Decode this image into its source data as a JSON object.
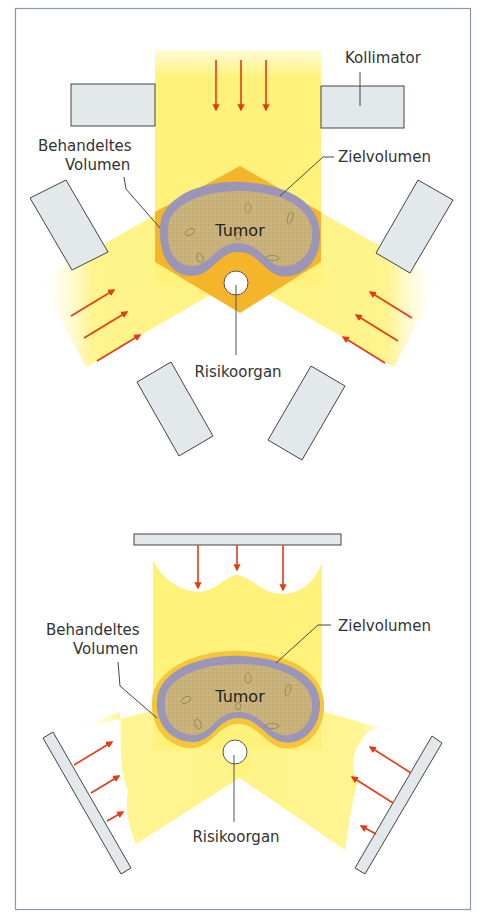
{
  "colors": {
    "frame": "#8a97b0",
    "beam": "#fff27a",
    "beam_light": "#fffbd0",
    "treated_volume": "#f5b52a",
    "target_volume": "#9b96b8",
    "tumor": "#c9b27a",
    "collimator_fill": "#e3e8ea",
    "collimator_stroke": "#444444",
    "arrow": "#e63a14",
    "leader": "#444444"
  },
  "top_diagram": {
    "labels": {
      "collimator": "Kollimator",
      "treated_volume_line1": "Behandeltes",
      "treated_volume_line2": "Volumen",
      "target_volume": "Zielvolumen",
      "tumor": "Tumor",
      "organ_at_risk": "Risikoorgan"
    }
  },
  "bottom_diagram": {
    "labels": {
      "treated_volume_line1": "Behandeltes",
      "treated_volume_line2": "Volumen",
      "target_volume": "Zielvolumen",
      "tumor": "Tumor",
      "organ_at_risk": "Risikoorgan"
    }
  }
}
